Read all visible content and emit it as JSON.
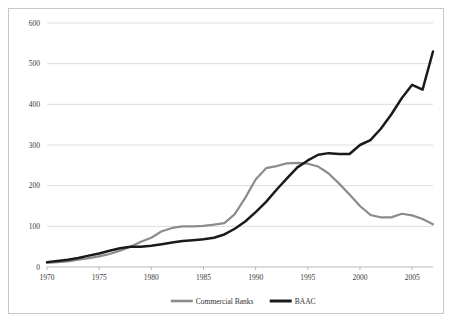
{
  "chart_data": {
    "type": "line",
    "title": "",
    "subtitle": "",
    "xlabel": "",
    "ylabel": "",
    "xlim": [
      1970,
      2007
    ],
    "ylim": [
      0,
      600
    ],
    "grid": true,
    "legend_position": "bottom",
    "y_ticks": [
      "0",
      "100",
      "200",
      "300",
      "400",
      "500",
      "600"
    ],
    "y_tick_values": [
      0,
      100,
      200,
      300,
      400,
      500,
      600
    ],
    "x_ticks": [
      "1970",
      "1975",
      "1980",
      "1985",
      "1990",
      "1995",
      "2000",
      "2005"
    ],
    "x_tick_values": [
      1970,
      1975,
      1980,
      1985,
      1990,
      1995,
      2000,
      2005
    ],
    "x": [
      1970,
      1971,
      1972,
      1973,
      1974,
      1975,
      1976,
      1977,
      1978,
      1979,
      1980,
      1981,
      1982,
      1983,
      1984,
      1985,
      1986,
      1987,
      1988,
      1989,
      1990,
      1991,
      1992,
      1993,
      1994,
      1995,
      1996,
      1997,
      1998,
      1999,
      2000,
      2001,
      2002,
      2003,
      2004,
      2005,
      2006,
      2007
    ],
    "series": [
      {
        "name": "Commercial Banks",
        "color": "#8c8c8c",
        "values": [
          10,
          12,
          14,
          18,
          22,
          26,
          32,
          40,
          50,
          62,
          72,
          88,
          96,
          100,
          100,
          101,
          104,
          108,
          130,
          170,
          215,
          243,
          248,
          255,
          256,
          254,
          247,
          230,
          205,
          178,
          150,
          128,
          122,
          122,
          131,
          127,
          118,
          105
        ]
      },
      {
        "name": "BAAC",
        "color": "#1a1a1a",
        "values": [
          12,
          15,
          18,
          22,
          28,
          33,
          40,
          46,
          50,
          50,
          52,
          56,
          60,
          64,
          66,
          68,
          72,
          80,
          94,
          112,
          135,
          160,
          190,
          218,
          245,
          262,
          276,
          280,
          278,
          278,
          300,
          312,
          340,
          375,
          415,
          448,
          436,
          530
        ]
      }
    ],
    "legend": [
      {
        "label": "Commercial Banks",
        "color": "#8c8c8c"
      },
      {
        "label": "BAAC",
        "color": "#1a1a1a"
      }
    ]
  },
  "colors": {
    "commercial_banks": "#8c8c8c",
    "baac": "#1a1a1a",
    "gridline": "#d4d4d4",
    "axis": "#b0b0b0",
    "border": "#c8c8c8",
    "background": "#ffffff"
  }
}
